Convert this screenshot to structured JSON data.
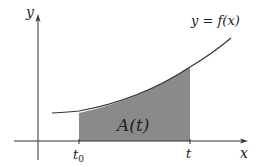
{
  "diagram": {
    "axes": {
      "x_label": "x",
      "y_label": "y"
    },
    "curve_label": "y = f(x)",
    "area_label": "A(t)",
    "ticks": {
      "start": "t",
      "start_sub": "0",
      "end": "t"
    },
    "colors": {
      "shade": "#8a8a8a",
      "axis": "#333333",
      "curve": "#333333"
    }
  }
}
